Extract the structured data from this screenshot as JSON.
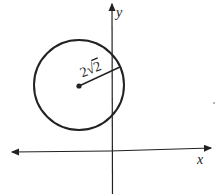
{
  "diagram": {
    "type": "coordinate-plane-circle",
    "axes": {
      "x_label": "x",
      "y_label": "y"
    },
    "circle": {
      "radius_label_coef": "2",
      "radius_label_root": "2",
      "radius_label": "2√2",
      "center_marked": true
    },
    "colors": {
      "stroke": "#222222",
      "background": "#ffffff"
    }
  }
}
